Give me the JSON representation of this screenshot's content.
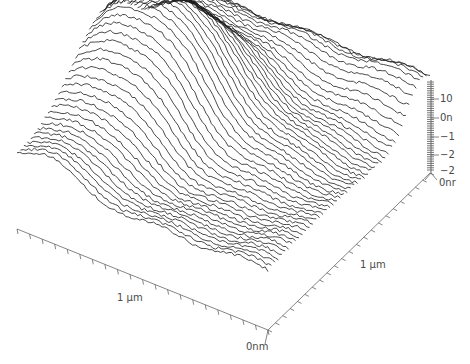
{
  "chart_data": {
    "type": "surface",
    "title": "",
    "trace_count": 48,
    "colors": {
      "trace": "#1a1a1a",
      "axis": "#666666",
      "background": "#ffffff"
    },
    "x_axis": {
      "label": "1 µm",
      "origin_label": "0nm",
      "tick_count": 20
    },
    "y_axis": {
      "label": "1 µm",
      "tick_count": 22
    },
    "z_axis": {
      "tick_labels": [
        "10",
        "0n",
        "−1",
        "−2",
        "−2"
      ],
      "origin_label": "0nr"
    },
    "grid": false,
    "legend": null
  }
}
